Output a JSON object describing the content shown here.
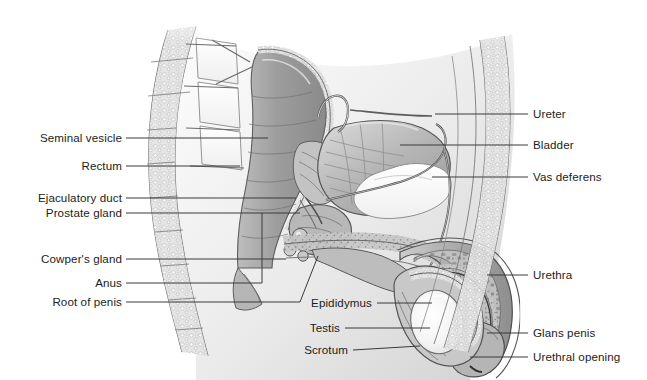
{
  "figure": {
    "style": "grayscale medical illustration",
    "background_color": "#ffffff",
    "label_color": "#1c1c1c",
    "leader_line_color": "#3a3a3a",
    "width": 647,
    "height": 380
  },
  "labels_left": [
    {
      "text": "Seminal vesicle",
      "text_x": 122,
      "text_y": 138,
      "line": "M126,138 L268,138"
    },
    {
      "text": "Rectum",
      "text_x": 122,
      "text_y": 166,
      "line": "M126,166 L240,166"
    },
    {
      "text": "Ejaculatory duct",
      "text_x": 122,
      "text_y": 198,
      "line": "M126,198 L296,198"
    },
    {
      "text": "Prostate gland",
      "text_x": 122,
      "text_y": 213,
      "line": "M126,213 L300,213"
    },
    {
      "text": "Cowper's gland",
      "text_x": 122,
      "text_y": 259,
      "line": "M126,259 L286,259"
    },
    {
      "text": "Anus",
      "text_x": 122,
      "text_y": 283,
      "line": "M126,283 L262,283 L262,213"
    },
    {
      "text": "Root of penis",
      "text_x": 122,
      "text_y": 302,
      "line": "M126,302 L300,302 L318,256"
    }
  ],
  "labels_right": [
    {
      "text": "Ureter",
      "text_x": 533,
      "text_y": 114,
      "line": "M528,114 L435,114"
    },
    {
      "text": "Bladder",
      "text_x": 533,
      "text_y": 145,
      "line": "M528,145 L400,145"
    },
    {
      "text": "Vas deferens",
      "text_x": 533,
      "text_y": 177,
      "line": "M528,177 L432,177"
    },
    {
      "text": "Urethra",
      "text_x": 533,
      "text_y": 275,
      "line": "M528,275 L487,275"
    },
    {
      "text": "Glans penis",
      "text_x": 533,
      "text_y": 333,
      "line": "M528,333 L487,333"
    },
    {
      "text": "Urethral opening",
      "text_x": 533,
      "text_y": 357,
      "line": "M528,357 L470,357"
    }
  ],
  "labels_center": [
    {
      "text": "Epididymus",
      "text_x": 372,
      "text_y": 303,
      "line": "M377,303 L432,303"
    },
    {
      "text": "Testis",
      "text_x": 340,
      "text_y": 328,
      "line": "M345,328 L430,328"
    },
    {
      "text": "Scrotum",
      "text_x": 348,
      "text_y": 350,
      "line": "M353,350 L420,346"
    }
  ]
}
